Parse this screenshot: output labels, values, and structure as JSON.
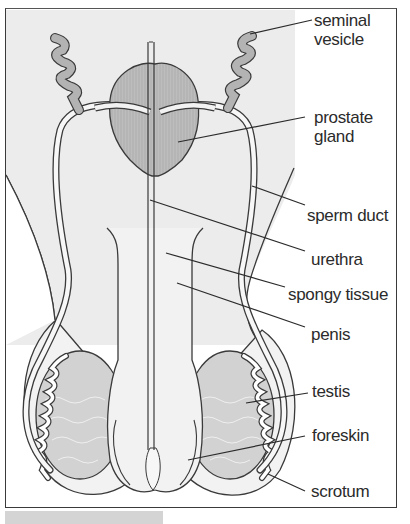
{
  "diagram": {
    "colors": {
      "background_shading": "#ececec",
      "tissue_fill": "#f2f2f2",
      "gland_fill": "#b5b5b5",
      "testis_fill": "#d2d2d2",
      "outline": "#3a3a3a",
      "label_text": "#2b2b2b"
    },
    "labels": [
      {
        "id": "seminal-vesicle",
        "line1": "seminal",
        "line2": "vesicle"
      },
      {
        "id": "prostate-gland",
        "line1": "prostate",
        "line2": "gland"
      },
      {
        "id": "sperm-duct",
        "line1": "sperm duct"
      },
      {
        "id": "urethra",
        "line1": "urethra"
      },
      {
        "id": "spongy-tissue",
        "line1": "spongy tissue"
      },
      {
        "id": "penis",
        "line1": "penis"
      },
      {
        "id": "testis",
        "line1": "testis"
      },
      {
        "id": "foreskin",
        "line1": "foreskin"
      },
      {
        "id": "scrotum",
        "line1": "scrotum"
      }
    ]
  }
}
